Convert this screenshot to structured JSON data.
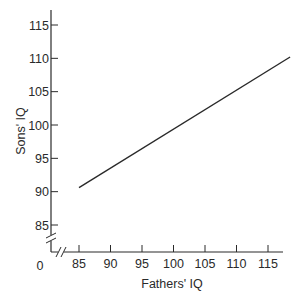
{
  "chart_data": {
    "type": "line",
    "title": "",
    "xlabel": "Fathers' IQ",
    "ylabel": "Sons' IQ",
    "x_ticks": [
      85,
      90,
      95,
      100,
      105,
      110,
      115
    ],
    "y_ticks": [
      85,
      90,
      95,
      100,
      105,
      110,
      115
    ],
    "origin_label": "0",
    "axis_breaks": [
      "x",
      "y"
    ],
    "xlim": [
      85,
      118.5
    ],
    "ylim": [
      85,
      115
    ],
    "grid": false,
    "legend": null,
    "series": [
      {
        "name": "Regression of sons' IQ on fathers' IQ",
        "x": [
          85,
          118.5
        ],
        "y": [
          90.6,
          110.2
        ]
      }
    ]
  },
  "colors": {
    "ink": "#2a2a2a",
    "background": "#ffffff"
  }
}
